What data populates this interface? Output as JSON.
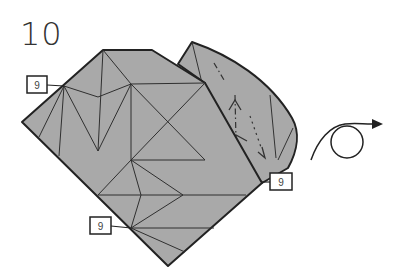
{
  "diagram": {
    "step_number": "10",
    "reference_labels": [
      {
        "id": "ref-left-top",
        "text": "9"
      },
      {
        "id": "ref-right",
        "text": "9"
      },
      {
        "id": "ref-bottom-left",
        "text": "9"
      }
    ],
    "action_symbol": "turn-over",
    "colors": {
      "paper": "#a9a9a9",
      "line": "#2a2a2a",
      "background": "#ffffff"
    }
  }
}
